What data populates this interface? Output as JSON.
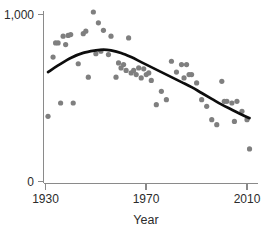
{
  "chart_data": {
    "type": "scatter",
    "title": "",
    "subtitle": "",
    "xlabel": "Year",
    "ylabel": "",
    "xlim": [
      1930,
      2012
    ],
    "ylim": [
      0,
      1000
    ],
    "grid": false,
    "legend": null,
    "x_ticks": [
      1930,
      1970,
      2010
    ],
    "x_tick_labels": [
      "1930",
      "1970",
      "2010"
    ],
    "y_ticks": [
      0,
      1000
    ],
    "y_tick_labels": [
      "0",
      "1,000"
    ],
    "point_color": "#7f7f7f",
    "line_color": "#0d0d0d",
    "axis_color": "#8a8a8a",
    "series": [
      {
        "name": "observations",
        "type": "scatter",
        "x": [
          1931,
          1933,
          1934,
          1935,
          1936,
          1937,
          1938,
          1939,
          1940,
          1941,
          1943,
          1945,
          1946,
          1947,
          1949,
          1950,
          1951,
          1952,
          1953,
          1955,
          1956,
          1958,
          1959,
          1960,
          1961,
          1962,
          1963,
          1964,
          1965,
          1966,
          1967,
          1968,
          1969,
          1970,
          1971,
          1972,
          1974,
          1976,
          1978,
          1980,
          1982,
          1984,
          1985,
          1986,
          1987,
          1988,
          1990,
          1992,
          1994,
          1996,
          1998,
          2000,
          2001,
          2002,
          2004,
          2005,
          2006,
          2008,
          2010,
          2011
        ],
        "y": [
          390,
          745,
          830,
          830,
          470,
          870,
          820,
          875,
          880,
          470,
          705,
          885,
          900,
          625,
          1015,
          765,
          950,
          780,
          905,
          760,
          870,
          625,
          710,
          680,
          700,
          665,
          860,
          650,
          665,
          640,
          680,
          620,
          675,
          640,
          650,
          605,
          460,
          540,
          490,
          720,
          655,
          700,
          620,
          700,
          640,
          640,
          590,
          490,
          450,
          370,
          340,
          600,
          480,
          480,
          470,
          360,
          480,
          420,
          370,
          195
        ],
        "marker_radius_px": 2.6
      },
      {
        "name": "smoothed-trend",
        "type": "line",
        "description": "LOESS smoothing curve",
        "x": [
          1931,
          1935,
          1940,
          1945,
          1950,
          1953,
          1956,
          1960,
          1964,
          1968,
          1972,
          1976,
          1980,
          1984,
          1988,
          1992,
          1996,
          2000,
          2004,
          2008,
          2011
        ],
        "y": [
          655,
          695,
          740,
          770,
          785,
          790,
          785,
          770,
          745,
          715,
          685,
          655,
          625,
          595,
          565,
          530,
          495,
          460,
          430,
          400,
          380
        ]
      }
    ]
  },
  "axis": {
    "x_label": "Year",
    "y_tick_top": "1,000",
    "y_tick_bottom": "0",
    "x_tick_1": "1930",
    "x_tick_2": "1970",
    "x_tick_3": "2010"
  }
}
